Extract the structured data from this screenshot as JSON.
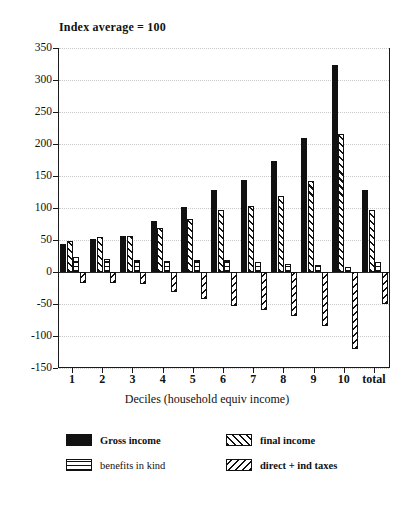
{
  "chart_data": {
    "type": "bar",
    "title": "Index average = 100",
    "xlabel": "Deciles (household equiv income)",
    "ylabel": "",
    "ylim": [
      -150,
      350
    ],
    "yticks": [
      350,
      300,
      250,
      200,
      150,
      100,
      50,
      0,
      -50,
      -100,
      -150
    ],
    "grid": true,
    "legend_position": "bottom",
    "categories": [
      "1",
      "2",
      "3",
      "4",
      "5",
      "6",
      "7",
      "8",
      "9",
      "10",
      "total"
    ],
    "series": [
      {
        "name": "Gross income",
        "fill": "solid",
        "values": [
          43,
          51,
          56,
          79,
          102,
          128,
          144,
          173,
          209,
          323,
          128
        ]
      },
      {
        "name": "final income",
        "fill": "hatch-r",
        "values": [
          48,
          54,
          56,
          68,
          83,
          97,
          103,
          119,
          142,
          216,
          97
        ]
      },
      {
        "name": "benefits in kind",
        "fill": "horiz",
        "values": [
          23,
          21,
          18,
          17,
          18,
          18,
          15,
          13,
          11,
          8,
          15
        ]
      },
      {
        "name": "direct + ind taxes",
        "fill": "hatch-l",
        "values": [
          -17,
          -17,
          -19,
          -32,
          -42,
          -53,
          -59,
          -68,
          -85,
          -120,
          -50
        ]
      }
    ]
  },
  "legend": {
    "entries": [
      {
        "label": "Gross income",
        "fill": "solid",
        "bold": true
      },
      {
        "label": "final income",
        "fill": "hatch-r",
        "bold": true
      },
      {
        "label": "benefits in kind",
        "fill": "horiz",
        "bold": false
      },
      {
        "label": "direct + ind taxes",
        "fill": "hatch-l",
        "bold": true
      }
    ]
  }
}
